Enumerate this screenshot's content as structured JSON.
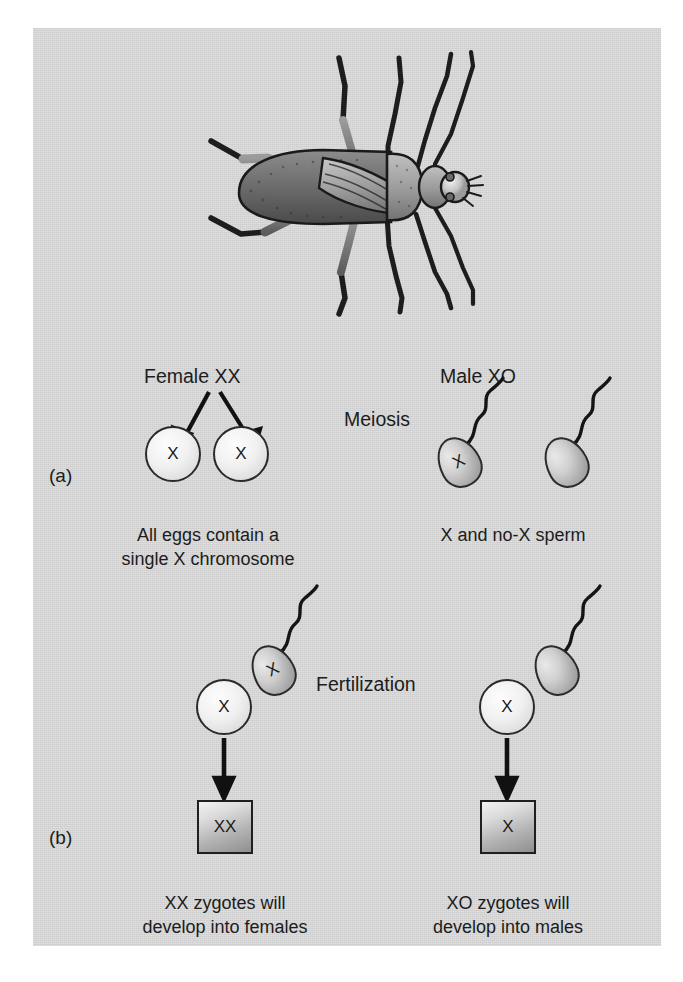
{
  "figure": {
    "organism_illustration": "insect-bug-illustration",
    "panels": [
      {
        "letter": "(a)",
        "stage_label": "Meiosis",
        "female": {
          "heading": "Female XX",
          "gametes": [
            {
              "type": "egg",
              "chromosome": "X"
            },
            {
              "type": "egg",
              "chromosome": "X"
            }
          ],
          "caption_line1": "All eggs contain a",
          "caption_line2": "single X chromosome"
        },
        "male": {
          "heading": "Male XO",
          "gametes": [
            {
              "type": "sperm",
              "chromosome": "X"
            },
            {
              "type": "sperm",
              "chromosome": ""
            }
          ],
          "caption_line1": "X and no-X sperm",
          "caption_line2": ""
        }
      },
      {
        "letter": "(b)",
        "stage_label": "Fertilization",
        "crosses": [
          {
            "egg_chromosome": "X",
            "sperm_chromosome": "X",
            "zygote_genotype": "XX",
            "caption_line1": "XX zygotes will",
            "caption_line2": "develop into females"
          },
          {
            "egg_chromosome": "X",
            "sperm_chromosome": "",
            "zygote_genotype": "X",
            "caption_line1": "XO zygotes will",
            "caption_line2": "develop into males"
          }
        ]
      }
    ]
  },
  "colors": {
    "panel_background": "#d2d2d2",
    "page_background": "#ffffff",
    "ink": "#1c1c1c",
    "outline": "#2a2a2a"
  }
}
